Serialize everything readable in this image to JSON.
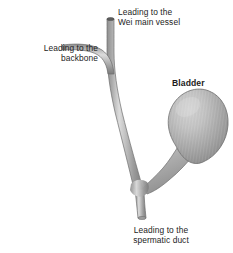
{
  "figure": {
    "background_color": "#ffffff",
    "text_color": "#1c1c1c"
  },
  "labels": {
    "wei_vessel": {
      "line1": "Leading to the",
      "line2": "Wei main vessel",
      "bold": false
    },
    "backbone": {
      "line1": "Leading to the",
      "line2": "backbone",
      "bold": false
    },
    "bladder": {
      "line1": "Bladder",
      "bold": true
    },
    "spermatic_duct": {
      "line1": "Leading to the",
      "line2": "spermatic duct",
      "bold": false
    }
  },
  "anatomy": {
    "bladder_organ": "bladder",
    "upper_duct": "duct leading to the Wei main vessel",
    "left_duct": "duct leading to the backbone",
    "lower_duct": "duct leading to the spermatic duct",
    "junction": "y-junction of ducts"
  },
  "colors": {
    "tube_edge": "#9a9a9a",
    "tube_mid": "#b4b4b4",
    "tube_highlight": "#d8d8d8",
    "tube_shadow": "#7e7e7e",
    "bladder_highlight": "#cdcdcd",
    "bladder_mid": "#a5a5a5",
    "bladder_shadow": "#838383",
    "outline": "#6f6f6f",
    "lumen_dark": "#5a5a5a"
  }
}
